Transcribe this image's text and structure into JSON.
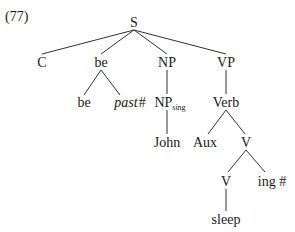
{
  "example_number": "(77)",
  "tree": {
    "nodes": {
      "S": "S",
      "C": "C",
      "be_mid": "be",
      "NP": "NP",
      "VP": "VP",
      "be_leaf": "be",
      "past_word": "past",
      "past_hash": "#",
      "NP_sing_base": "NP",
      "NP_sing_sub": "sing",
      "Verb": "Verb",
      "John": "John",
      "Aux": "Aux",
      "V_upper": "V",
      "V_lower": "V",
      "ing": "ing #",
      "sleep": "sleep"
    },
    "edges": [
      [
        "S",
        "C"
      ],
      [
        "S",
        "be_mid"
      ],
      [
        "S",
        "NP"
      ],
      [
        "S",
        "VP"
      ],
      [
        "be_mid",
        "be_leaf"
      ],
      [
        "be_mid",
        "past"
      ],
      [
        "NP",
        "NP_sing"
      ],
      [
        "NP_sing",
        "John"
      ],
      [
        "VP",
        "Verb"
      ],
      [
        "Verb",
        "Aux"
      ],
      [
        "Verb",
        "V_upper"
      ],
      [
        "V_upper",
        "V_lower"
      ],
      [
        "V_upper",
        "ing"
      ],
      [
        "V_lower",
        "sleep"
      ]
    ]
  }
}
